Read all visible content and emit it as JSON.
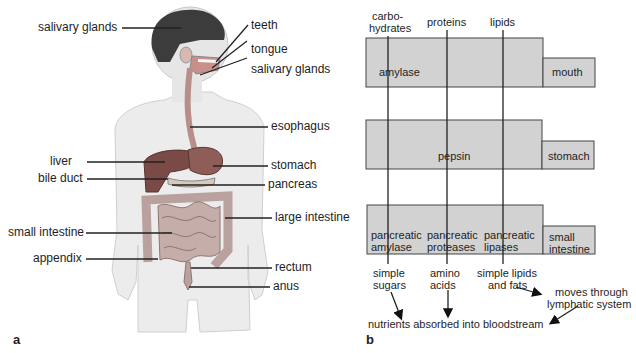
{
  "panel_a": {
    "letter": "a",
    "labels_left": [
      "salivary glands",
      "liver",
      "bile duct",
      "small intestine",
      "appendix"
    ],
    "labels_right": [
      "teeth",
      "tongue",
      "salivary glands",
      "esophagus",
      "stomach",
      "pancreas",
      "large intestine",
      "rectum",
      "anus"
    ]
  },
  "panel_b": {
    "letter": "b",
    "nutrients": [
      "carbo-\nhydrates",
      "proteins",
      "lipids"
    ],
    "nutrient_lines": {
      "carb1": "carbo-",
      "carb2": "hydrates",
      "proteins": "proteins",
      "lipids": "lipids"
    },
    "organs": [
      {
        "name": "mouth",
        "enzymes": [
          "amylase"
        ]
      },
      {
        "name": "stomach",
        "enzymes": [
          "pepsin"
        ]
      },
      {
        "name": "small intestine",
        "name_lines": [
          "small",
          "intestine"
        ],
        "enzymes": [
          "pancreatic amylase",
          "pancreatic proteases",
          "pancreatic lipases"
        ]
      }
    ],
    "enzyme_lines": {
      "pa1": "pancreatic",
      "pa2": "amylase",
      "pp1": "pancreatic",
      "pp2": "proteases",
      "pl1": "pancreatic",
      "pl2": "lipases"
    },
    "products": {
      "sugars1": "simple",
      "sugars2": "sugars",
      "amino1": "amino",
      "amino2": "acids",
      "lipids1": "simple lipids",
      "lipids2": "and fats"
    },
    "lymph1": "moves through",
    "lymph2": "lymphatic system",
    "bloodstream": "nutrients absorbed into bloodstream"
  },
  "colors": {
    "box_fill": "#d2d2d2",
    "box_stroke": "#444444",
    "liver": "#7a4a46",
    "intestine": "#b9a29e"
  }
}
